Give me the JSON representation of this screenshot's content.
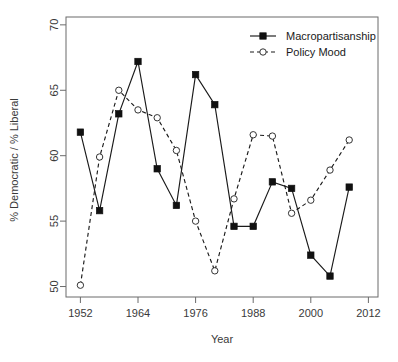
{
  "chart_data": {
    "type": "line",
    "title": "",
    "subtitle": "",
    "xlabel": "Year",
    "ylabel": "% Democratic / % Liberal",
    "xlim": [
      1949,
      2014
    ],
    "ylim": [
      49.2,
      70.6
    ],
    "xticks": [
      1952,
      1964,
      1976,
      1988,
      2000,
      2012
    ],
    "xtick_labels": [
      "1952",
      "1964",
      "1976",
      "1988",
      "2000",
      "2012"
    ],
    "yticks": [
      50,
      55,
      60,
      65,
      70
    ],
    "ytick_labels": [
      "50",
      "55",
      "60",
      "65",
      "70"
    ],
    "grid": false,
    "legend_position": "top-right",
    "x": [
      1952,
      1956,
      1960,
      1964,
      1968,
      1972,
      1976,
      1980,
      1984,
      1988,
      1992,
      1996,
      2000,
      2004,
      2008
    ],
    "series": [
      {
        "name": "Macropartisanship",
        "marker": "filled-square",
        "line_style": "solid",
        "color": "#111111",
        "values": [
          61.8,
          55.8,
          63.2,
          67.2,
          59.0,
          56.2,
          66.2,
          63.9,
          54.6,
          54.6,
          58.0,
          57.5,
          52.4,
          50.8,
          57.6
        ]
      },
      {
        "name": "Policy Mood",
        "marker": "open-circle",
        "line_style": "dashed",
        "color": "#333333",
        "values": [
          50.1,
          59.9,
          65.0,
          63.5,
          62.9,
          60.4,
          55.0,
          51.2,
          56.7,
          61.6,
          61.5,
          55.6,
          56.6,
          58.9,
          61.2
        ]
      }
    ]
  },
  "legend": {
    "entries": [
      {
        "label": "Macropartisanship"
      },
      {
        "label": "Policy Mood"
      }
    ]
  },
  "axes": {
    "x_title": "Year",
    "y_title": "% Democratic / % Liberal"
  }
}
